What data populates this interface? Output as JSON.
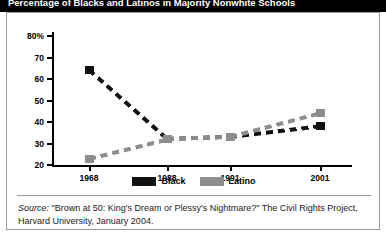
{
  "title": "Percentage of Blacks and Latinos in Majority Nonwhite Schools",
  "legend": {
    "items": [
      {
        "label": "Black",
        "color": "#111111"
      },
      {
        "label": "Latino",
        "color": "#8d8d8d"
      }
    ]
  },
  "source": {
    "label": "Source:",
    "text": " \"Brown at 50: King's Dream or Plessy's Nightmare?\" The Civil Rights Project, Harvard University, January 2004."
  },
  "chart_data": {
    "type": "line",
    "title": "Percentage of Blacks and Latinos in Majority Nonwhite Schools",
    "xlabel": "",
    "ylabel": "",
    "ylim": [
      20,
      80
    ],
    "yticks": [
      20,
      30,
      40,
      50,
      60,
      70,
      80
    ],
    "ytick_labels": [
      "20",
      "30",
      "40",
      "50",
      "60",
      "70",
      "80%"
    ],
    "categories": [
      "1968",
      "1988",
      "1991",
      "2001"
    ],
    "x": [
      1968,
      1988,
      1991,
      2001
    ],
    "grid": false,
    "legend_position": "bottom-center",
    "line_style": "dashed",
    "marker": "square",
    "series": [
      {
        "name": "Black",
        "color": "#111111",
        "values": [
          64,
          32,
          33,
          38
        ]
      },
      {
        "name": "Latino",
        "color": "#8d8d8d",
        "values": [
          23,
          32,
          33,
          44
        ]
      }
    ]
  }
}
